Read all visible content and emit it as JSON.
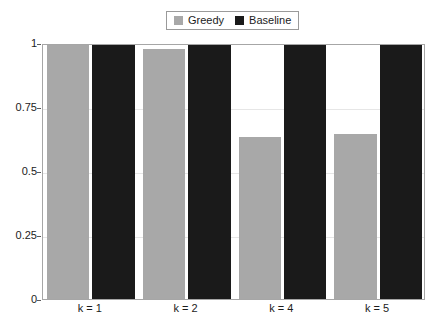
{
  "chart_data": {
    "type": "bar",
    "title": "",
    "subtitle": "",
    "xlabel": "",
    "ylabel": "",
    "categories": [
      "k = 1",
      "k = 2",
      "k = 4",
      "k = 5"
    ],
    "series": [
      {
        "name": "Greedy",
        "color": "#a8a8a8",
        "values": [
          1.0,
          0.977,
          0.633,
          0.645
        ]
      },
      {
        "name": "Baseline",
        "color": "#1a1a1a",
        "values": [
          1.0,
          1.0,
          1.0,
          1.0
        ]
      }
    ],
    "ylim": [
      0,
      1
    ],
    "yticks": [
      0,
      0.25,
      0.5,
      0.75,
      1
    ],
    "ytick_labels": [
      "0",
      "0.25",
      "0.5",
      "0.75",
      "1"
    ],
    "grid": "horizontal",
    "legend_position": "top-center",
    "legend_entries": [
      "Greedy",
      "Baseline"
    ],
    "annotations": []
  },
  "legend": {
    "greedy_label": "Greedy",
    "baseline_label": "Baseline",
    "greedy_color": "#a8a8a8",
    "baseline_color": "#1a1a1a"
  },
  "axes": {
    "y_tick_labels": [
      "1",
      "0.75",
      "0.5",
      "0.25",
      "0"
    ],
    "x_tick_labels": [
      "k = 1",
      "k = 2",
      "k = 4",
      "k = 5"
    ],
    "axis_color": "#a6a6a6",
    "grid_color": "#e6e6e6"
  }
}
